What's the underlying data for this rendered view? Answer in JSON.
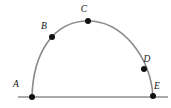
{
  "figure": {
    "canvas": {
      "width": 171,
      "height": 108,
      "background": "#ffffff"
    },
    "style": {
      "arc_color": "#8a8a8a",
      "arc_width": 1.6,
      "baseline_color": "#8d8d8d",
      "baseline_width": 1.5,
      "point_color": "#121212",
      "point_radius": 3.0,
      "label_color": "#111111"
    },
    "baseline": {
      "x1": 18,
      "y1": 97,
      "x2": 168,
      "y2": 97
    },
    "arc_path": "M 32 97 C 33 55, 52 21, 88 21 C 122 21, 150 56, 153 96",
    "points": [
      {
        "id": "A",
        "label": "A",
        "cx": 32,
        "cy": 97,
        "lx": 16,
        "ly": 85
      },
      {
        "id": "B",
        "label": "B",
        "cx": 52,
        "cy": 37,
        "lx": 44,
        "ly": 27
      },
      {
        "id": "C",
        "label": "C",
        "cx": 88,
        "cy": 21,
        "lx": 84,
        "ly": 10
      },
      {
        "id": "D",
        "label": "D",
        "cx": 144,
        "cy": 69,
        "lx": 147,
        "ly": 60
      },
      {
        "id": "E",
        "label": "E",
        "cx": 153,
        "cy": 96,
        "lx": 157,
        "ly": 87
      }
    ]
  },
  "chart_data": {
    "type": "scatter",
    "xlabel": "",
    "ylabel": "",
    "xlim": [
      0,
      171
    ],
    "ylim": [
      0,
      108
    ],
    "grid": false,
    "legend": "none",
    "x": [
      32,
      52,
      88,
      144,
      153
    ],
    "y": [
      97,
      37,
      21,
      69,
      96
    ],
    "point_labels": [
      "A",
      "B",
      "C",
      "D",
      "E"
    ],
    "annotations": [
      "Gray arc rising from A, through B, apex at C, descending through D to E",
      "Horizontal gray baseline segment passing through A and E"
    ]
  }
}
